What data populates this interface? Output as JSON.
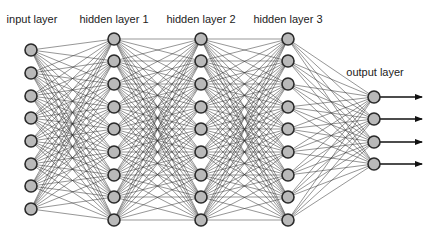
{
  "diagram": {
    "colors": {
      "node_fill": "#b9b9b9",
      "node_stroke": "#2a2a2a",
      "edge": "#333333",
      "background": "#ffffff"
    },
    "node_radius": 6,
    "layers": [
      {
        "label": "input layer",
        "x": 31,
        "label_x": 32,
        "label_y": 13,
        "nodes": [
          50,
          73,
          96,
          118,
          141,
          164,
          186,
          209
        ]
      },
      {
        "label": "hidden layer 1",
        "x": 114,
        "label_x": 114,
        "label_y": 13,
        "nodes": [
          39,
          61,
          84,
          107,
          129,
          152,
          175,
          197,
          220
        ]
      },
      {
        "label": "hidden layer 2",
        "x": 201,
        "label_x": 201,
        "label_y": 13,
        "nodes": [
          39,
          61,
          84,
          107,
          129,
          152,
          175,
          197,
          220
        ]
      },
      {
        "label": "hidden layer 3",
        "x": 288,
        "label_x": 288,
        "label_y": 13,
        "nodes": [
          39,
          61,
          84,
          107,
          129,
          152,
          175,
          197,
          220
        ]
      },
      {
        "label": "output layer",
        "x": 374,
        "label_x": 375,
        "label_y": 66,
        "nodes": [
          97,
          119,
          142,
          164
        ]
      }
    ],
    "output_arrow_end_x": 422
  }
}
